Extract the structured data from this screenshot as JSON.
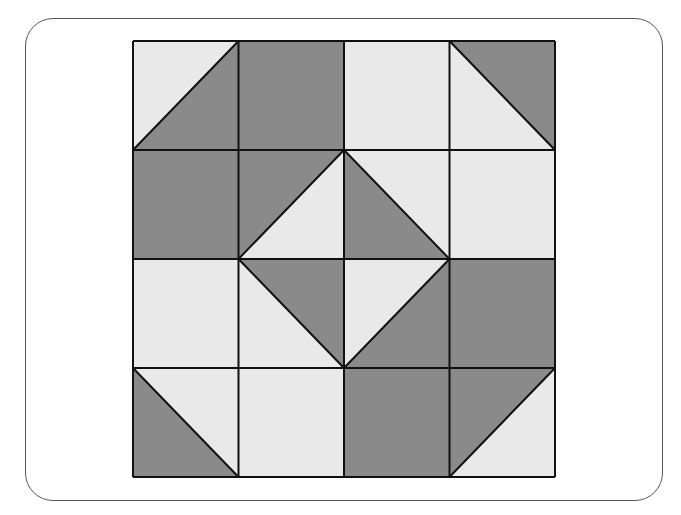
{
  "diagram": {
    "type": "quilt-block",
    "grid": {
      "rows": 4,
      "cols": 4
    },
    "colors": {
      "dark": "#8a8a8a",
      "light": "#e9e9e9",
      "line": "#111111",
      "frame": "#555555"
    },
    "cells": [
      [
        {
          "type": "split",
          "diag": "bl-tr",
          "a": "light",
          "b": "dark"
        },
        {
          "type": "solid",
          "fill": "dark"
        },
        {
          "type": "solid",
          "fill": "light"
        },
        {
          "type": "split",
          "diag": "tl-br",
          "a": "dark",
          "b": "light"
        }
      ],
      [
        {
          "type": "solid",
          "fill": "dark"
        },
        {
          "type": "split",
          "diag": "bl-tr",
          "a": "dark",
          "b": "light"
        },
        {
          "type": "split",
          "diag": "tl-br",
          "a": "light",
          "b": "dark"
        },
        {
          "type": "solid",
          "fill": "light"
        }
      ],
      [
        {
          "type": "solid",
          "fill": "light"
        },
        {
          "type": "split",
          "diag": "tl-br",
          "a": "dark",
          "b": "light"
        },
        {
          "type": "split",
          "diag": "bl-tr",
          "a": "light",
          "b": "dark"
        },
        {
          "type": "solid",
          "fill": "dark"
        }
      ],
      [
        {
          "type": "split",
          "diag": "tl-br",
          "a": "light",
          "b": "dark"
        },
        {
          "type": "solid",
          "fill": "light"
        },
        {
          "type": "solid",
          "fill": "dark"
        },
        {
          "type": "split",
          "diag": "bl-tr",
          "a": "dark",
          "b": "light"
        }
      ]
    ]
  }
}
